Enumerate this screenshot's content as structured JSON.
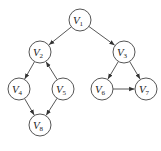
{
  "diagram": {
    "type": "directed-graph",
    "nodes": [
      {
        "id": "V1",
        "label": "V",
        "sub": "1",
        "x": 80,
        "y": 20
      },
      {
        "id": "V2",
        "label": "V",
        "sub": "2",
        "x": 40,
        "y": 52
      },
      {
        "id": "V3",
        "label": "V",
        "sub": "3",
        "x": 124,
        "y": 52
      },
      {
        "id": "V4",
        "label": "V",
        "sub": "4",
        "x": 19,
        "y": 89
      },
      {
        "id": "V5",
        "label": "V",
        "sub": "5",
        "x": 63,
        "y": 89
      },
      {
        "id": "V6",
        "label": "V",
        "sub": "6",
        "x": 102,
        "y": 89
      },
      {
        "id": "V7",
        "label": "V",
        "sub": "7",
        "x": 146,
        "y": 89
      },
      {
        "id": "V8",
        "label": "V",
        "sub": "8",
        "x": 40,
        "y": 125
      }
    ],
    "edges": [
      {
        "from": "V1",
        "to": "V2"
      },
      {
        "from": "V1",
        "to": "V3"
      },
      {
        "from": "V2",
        "to": "V4"
      },
      {
        "from": "V5",
        "to": "V2"
      },
      {
        "from": "V4",
        "to": "V8"
      },
      {
        "from": "V5",
        "to": "V8"
      },
      {
        "from": "V3",
        "to": "V6"
      },
      {
        "from": "V3",
        "to": "V7"
      },
      {
        "from": "V6",
        "to": "V7"
      }
    ],
    "node_radius": 11
  }
}
